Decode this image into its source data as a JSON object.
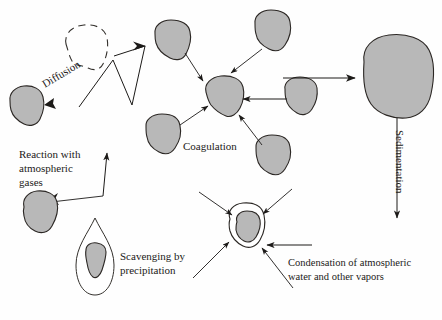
{
  "figure": {
    "name": "atmospheric-particle-processes",
    "background_color": "#fefefe",
    "width": 442,
    "height": 320
  },
  "style": {
    "particle_fill": "#b8b8b8",
    "particle_stroke": "#2b2724",
    "text_color": "#1c1a18",
    "arrow_color": "#1c1a18",
    "droplet_fill": "#ffffff"
  },
  "labels": {
    "diffusion": "Diffusion",
    "reaction_line1": "Reaction with",
    "reaction_line2": "atmospheric",
    "reaction_line3": "gases",
    "coagulation": "Coagulation",
    "scavenging_line1": "Scavenging by",
    "scavenging_line2": "precipitation",
    "condensation_line1": "Condensation of atmospheric",
    "condensation_line2": "water and other vapors",
    "sedimentation": "Sedimentation"
  },
  "elements": {
    "dashed_particle": "dashed-outline-particle",
    "diffusion_particle": "diffusion-target-particle",
    "reaction_particle": "reaction-target-particle",
    "coagulation_center": "coagulation-center-particle",
    "coagulation_satellites": [
      "coagulation-satellite-top-left",
      "coagulation-satellite-top-right",
      "coagulation-satellite-bottom-left",
      "coagulation-satellite-bottom-right",
      "coagulation-satellite-right"
    ],
    "scavenging_droplet": "precipitation-droplet",
    "scavenging_particle": "scavenged-particle",
    "condensation_core": "condensation-core-particle",
    "condensation_halo": "condensation-vapor-halo",
    "sedimenting_particle": "large-sedimenting-particle"
  },
  "arrows": {
    "diffusion": "diffusion-arrow",
    "reaction": "reaction-arrow",
    "coagulation_inbound": "coagulation-inbound-arrows",
    "growth": "growth-arrow-to-large-particle",
    "sedimentation": "sedimentation-arrow-down",
    "condensation_inbound": "condensation-inbound-arrows"
  }
}
